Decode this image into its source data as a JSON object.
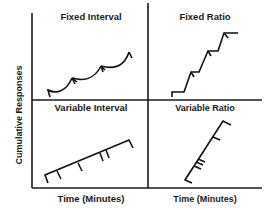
{
  "diagram": {
    "y_axis_label": "Cumulative Responses",
    "x_axis_label": "Time (Minutes)",
    "panels": [
      {
        "id": "fixed-interval",
        "label": "Fixed Interval",
        "pattern": "scalloped curve with reinforcement marks at fixed time intervals"
      },
      {
        "id": "fixed-ratio",
        "label": "Fixed Ratio",
        "pattern": "step-like stair pattern with post-reinforcement pauses"
      },
      {
        "id": "variable-interval",
        "label": "Variable Interval",
        "pattern": "steady moderate-slope line with irregularly spaced reinforcement marks"
      },
      {
        "id": "variable-ratio",
        "label": "Variable Ratio",
        "pattern": "steep steady line with irregularly spaced reinforcement marks"
      }
    ],
    "colors": {
      "ink": "#111111",
      "background": "#ffffff"
    }
  }
}
